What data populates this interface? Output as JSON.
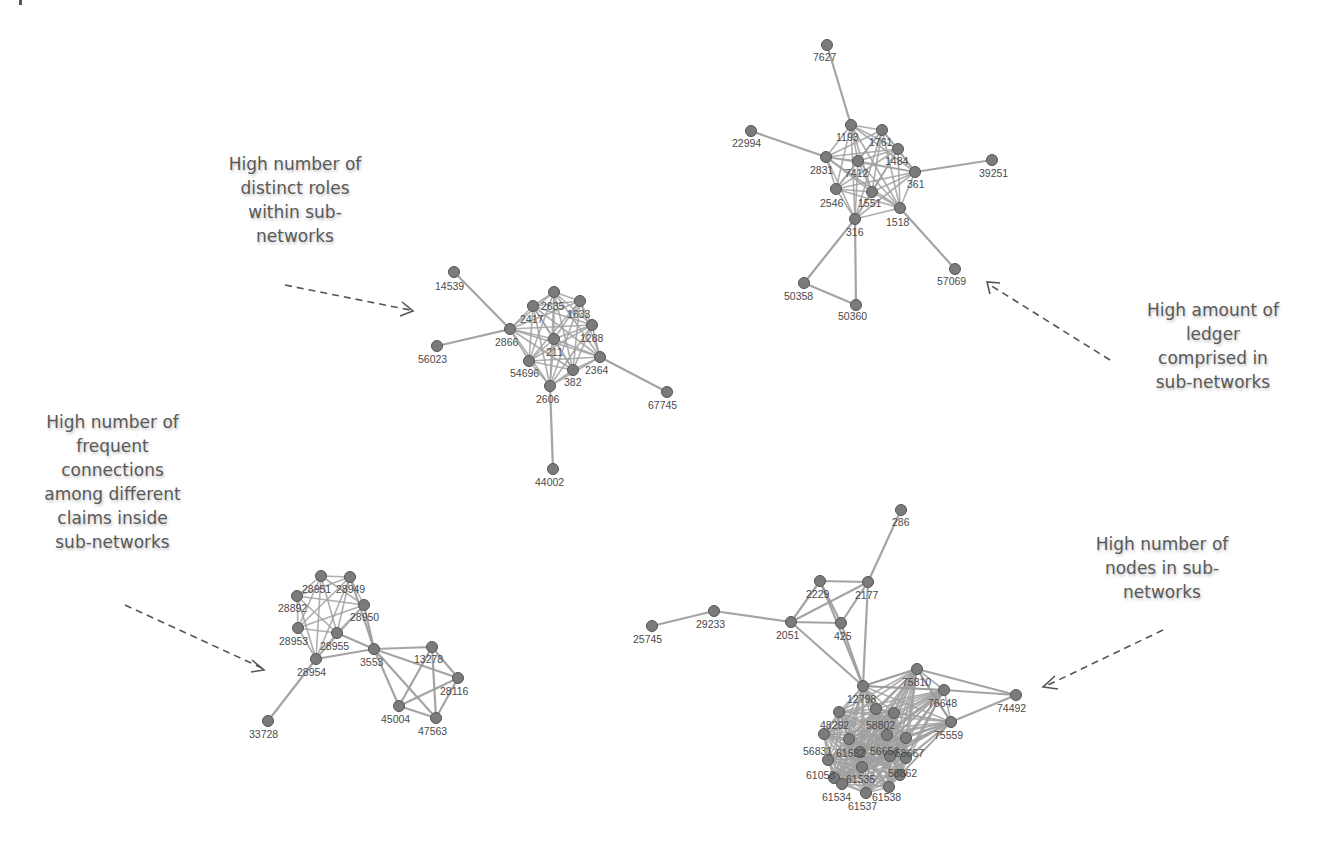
{
  "colors": {
    "node": "#7b7b7b",
    "edge": "#9a9a9a",
    "label": "#4a4a4a",
    "annotation": "#595959"
  },
  "annotations": [
    {
      "id": "distinct-roles",
      "text": "High number of distinct roles within sub-networks",
      "lines": [
        "High number of",
        "distinct roles",
        "within sub-",
        "networks"
      ]
    },
    {
      "id": "ledger-amount",
      "text": "High amount of ledger comprised in sub-networks",
      "lines": [
        "High amount of",
        "ledger",
        "comprised in",
        "sub-networks"
      ]
    },
    {
      "id": "frequent-connections",
      "text": "High number of frequent connections among different claims inside sub-networks",
      "lines": [
        "High number of",
        "frequent",
        "connections",
        "among different",
        "claims inside",
        "sub-networks"
      ]
    },
    {
      "id": "node-count",
      "text": "High number of nodes in sub-networks",
      "lines": [
        "High number of",
        "nodes in sub-",
        "networks"
      ]
    }
  ],
  "subnetworks": [
    {
      "id": "top-right",
      "nodes": [
        {
          "id": "7627",
          "x": 827,
          "y": 45,
          "lx": 813,
          "ly": 61
        },
        {
          "id": "22994",
          "x": 751,
          "y": 131,
          "lx": 732,
          "ly": 147
        },
        {
          "id": "1193",
          "x": 851,
          "y": 125,
          "lx": 836,
          "ly": 141
        },
        {
          "id": "1761",
          "x": 882,
          "y": 130,
          "lx": 869,
          "ly": 146
        },
        {
          "id": "1484",
          "x": 898,
          "y": 149,
          "lx": 885,
          "ly": 165
        },
        {
          "id": "2831",
          "x": 826,
          "y": 157,
          "lx": 810,
          "ly": 174
        },
        {
          "id": "7412",
          "x": 858,
          "y": 161,
          "lx": 845,
          "ly": 177
        },
        {
          "id": "361",
          "x": 915,
          "y": 172,
          "lx": 907,
          "ly": 188
        },
        {
          "id": "39251",
          "x": 992,
          "y": 160,
          "lx": 979,
          "ly": 177
        },
        {
          "id": "2546",
          "x": 836,
          "y": 189,
          "lx": 820,
          "ly": 207
        },
        {
          "id": "1551",
          "x": 872,
          "y": 192,
          "lx": 858,
          "ly": 207
        },
        {
          "id": "1518",
          "x": 900,
          "y": 208,
          "lx": 886,
          "ly": 226
        },
        {
          "id": "316",
          "x": 855,
          "y": 219,
          "lx": 846,
          "ly": 236
        },
        {
          "id": "50358",
          "x": 804,
          "y": 283,
          "lx": 784,
          "ly": 300
        },
        {
          "id": "50360",
          "x": 856,
          "y": 305,
          "lx": 838,
          "ly": 320
        },
        {
          "id": "57069",
          "x": 955,
          "y": 269,
          "lx": 937,
          "ly": 285
        }
      ],
      "edges": [
        [
          "7627",
          "1193"
        ],
        [
          "22994",
          "2831"
        ],
        [
          "39251",
          "361"
        ],
        [
          "1518",
          "57069"
        ],
        [
          "316",
          "50358"
        ],
        [
          "316",
          "50360"
        ],
        [
          "50358",
          "50360"
        ]
      ],
      "core": [
        "1193",
        "1761",
        "1484",
        "2831",
        "7412",
        "361",
        "2546",
        "1551",
        "1518",
        "316"
      ]
    },
    {
      "id": "center",
      "nodes": [
        {
          "id": "14539",
          "x": 454,
          "y": 272,
          "lx": 435,
          "ly": 290
        },
        {
          "id": "2635",
          "x": 554,
          "y": 292,
          "lx": 541,
          "ly": 310
        },
        {
          "id": "1633",
          "x": 580,
          "y": 301,
          "lx": 567,
          "ly": 318
        },
        {
          "id": "2417",
          "x": 533,
          "y": 306,
          "lx": 520,
          "ly": 323
        },
        {
          "id": "1288",
          "x": 592,
          "y": 325,
          "lx": 580,
          "ly": 342
        },
        {
          "id": "2866",
          "x": 510,
          "y": 329,
          "lx": 495,
          "ly": 346
        },
        {
          "id": "211",
          "x": 554,
          "y": 339,
          "lx": 546,
          "ly": 356
        },
        {
          "id": "56023",
          "x": 437,
          "y": 346,
          "lx": 418,
          "ly": 363
        },
        {
          "id": "2364",
          "x": 600,
          "y": 357,
          "lx": 585,
          "ly": 374
        },
        {
          "id": "54696",
          "x": 529,
          "y": 361,
          "lx": 510,
          "ly": 377
        },
        {
          "id": "382",
          "x": 573,
          "y": 370,
          "lx": 564,
          "ly": 386
        },
        {
          "id": "2606",
          "x": 550,
          "y": 386,
          "lx": 536,
          "ly": 403
        },
        {
          "id": "67745",
          "x": 667,
          "y": 392,
          "lx": 648,
          "ly": 409
        },
        {
          "id": "44002",
          "x": 553,
          "y": 469,
          "lx": 535,
          "ly": 486
        }
      ],
      "edges": [
        [
          "14539",
          "2866"
        ],
        [
          "56023",
          "2866"
        ],
        [
          "2364",
          "67745"
        ],
        [
          "2606",
          "44002"
        ]
      ],
      "core": [
        "2635",
        "1633",
        "2417",
        "1288",
        "2866",
        "211",
        "2364",
        "54696",
        "382",
        "2606"
      ]
    },
    {
      "id": "bottom-left",
      "nodes": [
        {
          "id": "28951",
          "x": 321,
          "y": 576,
          "lx": 302,
          "ly": 593
        },
        {
          "id": "28949",
          "x": 350,
          "y": 577,
          "lx": 336,
          "ly": 593
        },
        {
          "id": "28892",
          "x": 297,
          "y": 596,
          "lx": 278,
          "ly": 612
        },
        {
          "id": "28950",
          "x": 364,
          "y": 605,
          "lx": 350,
          "ly": 621
        },
        {
          "id": "28953",
          "x": 298,
          "y": 628,
          "lx": 279,
          "ly": 645
        },
        {
          "id": "28955",
          "x": 337,
          "y": 633,
          "lx": 320,
          "ly": 650
        },
        {
          "id": "3553",
          "x": 374,
          "y": 649,
          "lx": 360,
          "ly": 666
        },
        {
          "id": "28954",
          "x": 316,
          "y": 659,
          "lx": 297,
          "ly": 676
        },
        {
          "id": "13278",
          "x": 432,
          "y": 647,
          "lx": 414,
          "ly": 663
        },
        {
          "id": "28116",
          "x": 458,
          "y": 678,
          "lx": 440,
          "ly": 695
        },
        {
          "id": "45004",
          "x": 399,
          "y": 706,
          "lx": 381,
          "ly": 723
        },
        {
          "id": "47563",
          "x": 436,
          "y": 718,
          "lx": 418,
          "ly": 735
        },
        {
          "id": "33728",
          "x": 268,
          "y": 721,
          "lx": 249,
          "ly": 738
        }
      ],
      "edges": [
        [
          "28954",
          "33728"
        ],
        [
          "28954",
          "3553"
        ],
        [
          "3553",
          "13278"
        ],
        [
          "3553",
          "28116"
        ],
        [
          "3553",
          "45004"
        ],
        [
          "3553",
          "47563"
        ],
        [
          "13278",
          "28116"
        ],
        [
          "13278",
          "45004"
        ],
        [
          "13278",
          "47563"
        ],
        [
          "28116",
          "45004"
        ],
        [
          "28116",
          "47563"
        ],
        [
          "45004",
          "47563"
        ],
        [
          "28950",
          "3553"
        ],
        [
          "28949",
          "3553"
        ],
        [
          "28955",
          "3553"
        ]
      ],
      "core": [
        "28951",
        "28949",
        "28892",
        "28950",
        "28953",
        "28955",
        "28954"
      ]
    },
    {
      "id": "bottom-right",
      "nodes": [
        {
          "id": "286",
          "x": 901,
          "y": 510,
          "lx": 892,
          "ly": 526
        },
        {
          "id": "2229",
          "x": 820,
          "y": 581,
          "lx": 806,
          "ly": 598
        },
        {
          "id": "2177",
          "x": 868,
          "y": 582,
          "lx": 855,
          "ly": 599
        },
        {
          "id": "29233",
          "x": 714,
          "y": 611,
          "lx": 696,
          "ly": 628
        },
        {
          "id": "2051",
          "x": 791,
          "y": 622,
          "lx": 776,
          "ly": 639
        },
        {
          "id": "425",
          "x": 841,
          "y": 623,
          "lx": 834,
          "ly": 640
        },
        {
          "id": "25745",
          "x": 652,
          "y": 626,
          "lx": 633,
          "ly": 643
        },
        {
          "id": "75810",
          "x": 917,
          "y": 669,
          "lx": 902,
          "ly": 686
        },
        {
          "id": "12798",
          "x": 863,
          "y": 686,
          "lx": 847,
          "ly": 703
        },
        {
          "id": "74492",
          "x": 1016,
          "y": 695,
          "lx": 997,
          "ly": 712
        },
        {
          "id": "76648",
          "x": 944,
          "y": 690,
          "lx": 928,
          "ly": 707
        },
        {
          "id": "75559",
          "x": 951,
          "y": 722,
          "lx": 934,
          "ly": 739
        },
        {
          "id": "n1",
          "x": 839,
          "y": 712,
          "lx": null,
          "ly": null
        },
        {
          "id": "n2",
          "x": 876,
          "y": 709,
          "lx": null,
          "ly": null
        },
        {
          "id": "n3",
          "x": 894,
          "y": 713,
          "lx": null,
          "ly": null
        },
        {
          "id": "48292",
          "x": 824,
          "y": 734,
          "lx": 820,
          "ly": 729
        },
        {
          "id": "58802",
          "x": 887,
          "y": 735,
          "lx": 866,
          "ly": 729
        },
        {
          "id": "n4",
          "x": 849,
          "y": 739,
          "lx": null,
          "ly": null
        },
        {
          "id": "n5",
          "x": 906,
          "y": 738,
          "lx": null,
          "ly": null
        },
        {
          "id": "56831",
          "x": 828,
          "y": 760,
          "lx": 803,
          "ly": 755
        },
        {
          "id": "61532",
          "x": 860,
          "y": 752,
          "lx": 836,
          "ly": 757
        },
        {
          "id": "56656",
          "x": 890,
          "y": 756,
          "lx": 870,
          "ly": 755
        },
        {
          "id": "58667",
          "x": 906,
          "y": 758,
          "lx": 895,
          "ly": 757
        },
        {
          "id": "61058",
          "x": 834,
          "y": 778,
          "lx": 806,
          "ly": 779
        },
        {
          "id": "61535",
          "x": 862,
          "y": 767,
          "lx": 846,
          "ly": 783
        },
        {
          "id": "58862",
          "x": 900,
          "y": 775,
          "lx": 888,
          "ly": 777
        },
        {
          "id": "61534",
          "x": 842,
          "y": 784,
          "lx": 822,
          "ly": 801
        },
        {
          "id": "61538",
          "x": 889,
          "y": 787,
          "lx": 872,
          "ly": 801
        },
        {
          "id": "61537",
          "x": 866,
          "y": 793,
          "lx": 848,
          "ly": 810
        }
      ],
      "edges": [
        [
          "25745",
          "29233"
        ],
        [
          "29233",
          "2051"
        ],
        [
          "2051",
          "2229"
        ],
        [
          "2051",
          "2177"
        ],
        [
          "2051",
          "425"
        ],
        [
          "2051",
          "12798"
        ],
        [
          "2229",
          "2177"
        ],
        [
          "2229",
          "425"
        ],
        [
          "2229",
          "12798"
        ],
        [
          "2177",
          "425"
        ],
        [
          "2177",
          "12798"
        ],
        [
          "2177",
          "286"
        ],
        [
          "425",
          "12798"
        ],
        [
          "12798",
          "75810"
        ],
        [
          "75810",
          "74492"
        ],
        [
          "76648",
          "74492"
        ],
        [
          "75559",
          "74492"
        ],
        [
          "12798",
          "76648"
        ],
        [
          "75810",
          "75559"
        ]
      ],
      "core": [
        "12798",
        "75810",
        "76648",
        "75559",
        "n1",
        "n2",
        "n3",
        "48292",
        "58802",
        "n4",
        "n5",
        "56831",
        "61532",
        "56656",
        "58667",
        "61058",
        "61535",
        "58862",
        "61534",
        "61538",
        "61537"
      ]
    }
  ]
}
